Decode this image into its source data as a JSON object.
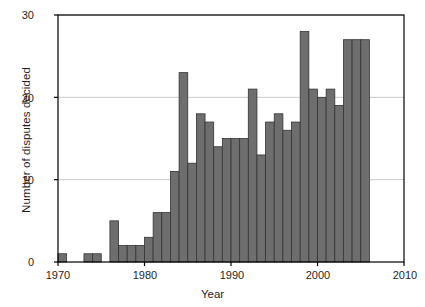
{
  "chart_data": {
    "type": "bar",
    "title": "",
    "subtitle": "",
    "xlabel": "Year",
    "ylabel": "Number of disputes decided",
    "xlim": [
      1970,
      2010
    ],
    "ylim": [
      0,
      30
    ],
    "xticks": [
      1970,
      1980,
      1990,
      2000,
      2010
    ],
    "yticks": [
      0,
      10,
      20,
      30
    ],
    "grid": "horizontal",
    "legend": "none",
    "bar_color": "#6e6e6e",
    "bar_edge_color": "#333333",
    "axis_color": "#000000",
    "grid_color": "#c8c8c8",
    "categories": [
      1970,
      1971,
      1972,
      1973,
      1974,
      1975,
      1976,
      1977,
      1978,
      1979,
      1980,
      1981,
      1982,
      1983,
      1984,
      1985,
      1986,
      1987,
      1988,
      1989,
      1990,
      1991,
      1992,
      1993,
      1994,
      1995,
      1996,
      1997,
      1998,
      1999,
      2000,
      2001,
      2002,
      2003,
      2004,
      2005
    ],
    "values": [
      1,
      0,
      0,
      1,
      1,
      0,
      5,
      2,
      2,
      2,
      3,
      6,
      6,
      11,
      23,
      12,
      18,
      17,
      14,
      15,
      15,
      15,
      21,
      13,
      17,
      18,
      16,
      17,
      28,
      21,
      20,
      21,
      19,
      27,
      27,
      27
    ]
  },
  "axes": {
    "y_tick_labels": [
      "30",
      "20",
      "10",
      "0"
    ],
    "x_tick_labels": [
      "1970",
      "1980",
      "1990",
      "2000",
      "2010"
    ],
    "y_axis_title": "Number of disputes decided",
    "x_axis_title": "Year"
  }
}
